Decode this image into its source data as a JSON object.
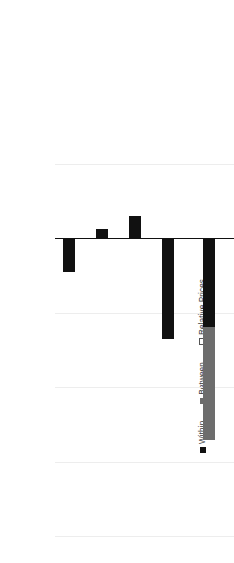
{
  "chart_data": {
    "type": "bar",
    "subtype": "stacked-bar",
    "title": "",
    "xlabel": "",
    "ylabel": "",
    "categories": [
      "Agriculture",
      "Mining and Quarrying",
      "Manufacturing",
      "Other Activities",
      "Total"
    ],
    "series": [
      {
        "name": "Within",
        "color": "#111111",
        "values": [
          2.2,
          -0.7,
          -1.6,
          6.7,
          5.9
        ]
      },
      {
        "name": "Between",
        "color": "#6d6d6d",
        "values": [
          0,
          0,
          0,
          0,
          7.6
        ]
      },
      {
        "name": "Relative Prices",
        "color": "#ffffff",
        "values": [
          0,
          0,
          0,
          0,
          0
        ]
      }
    ],
    "totals": [
      2.2,
      -0.7,
      -1.6,
      6.7,
      13.5
    ],
    "ylim": [
      -5.0,
      20.0
    ],
    "yticks": [
      20.0,
      15.0,
      10.0,
      5.0,
      0.0,
      -5.0
    ],
    "ytick_labels": [
      "20.0%",
      "15.0%",
      "10.0%",
      "5.0%",
      "0.0%",
      "-5.0%"
    ],
    "grid": true,
    "grid_axis": "y",
    "legend": [
      "Within",
      "Between",
      "Relative Prices"
    ],
    "legend_position": "left",
    "orientation": "rotated-90-ccw",
    "value_unit": "percent"
  },
  "legend": {
    "items": [
      {
        "label": "Within",
        "swatch": "filled-black-square"
      },
      {
        "label": "Between",
        "swatch": "filled-gray-square"
      },
      {
        "label": "Relative Prices",
        "swatch": "outlined-white-square"
      }
    ]
  },
  "axis": {
    "ticks": [
      "20.0%",
      "15.0%",
      "10.0%",
      "5.0%",
      "0.0%",
      "-5.0%"
    ]
  },
  "categories": [
    "Agriculture",
    "Mining and Quarrying",
    "Manufacturing",
    "Other Activities",
    "Total"
  ],
  "colors": {
    "within": "#111111",
    "between": "#6d6d6d",
    "relative_prices": "#ffffff",
    "grid": "#ededed",
    "axis": "#111111",
    "text": "#3b3b3b",
    "background": "#ffffff"
  }
}
